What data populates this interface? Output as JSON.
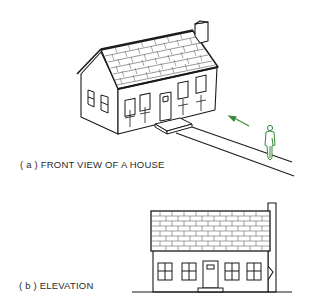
{
  "figure": {
    "parts": [
      {
        "id": "a",
        "caption": "( a ) FRONT VIEW OF A HOUSE",
        "view": "pictorial"
      },
      {
        "id": "b",
        "caption": "( b ) ELEVATION",
        "view": "orthographic"
      }
    ],
    "elements": {
      "house": {
        "windows_front": 5,
        "windows_side": 2,
        "door": 1,
        "chimney": 1,
        "roof": "shingled"
      },
      "walkway": "path leading to front step",
      "arrow": {
        "color": "#3a8a3a",
        "direction": "toward house"
      },
      "person": {
        "color": "#3a8a3a",
        "description": "observer viewing the house front"
      }
    },
    "colors": {
      "line": "#1a1a1a",
      "accent": "#3a8a3a",
      "background": "#ffffff"
    }
  }
}
